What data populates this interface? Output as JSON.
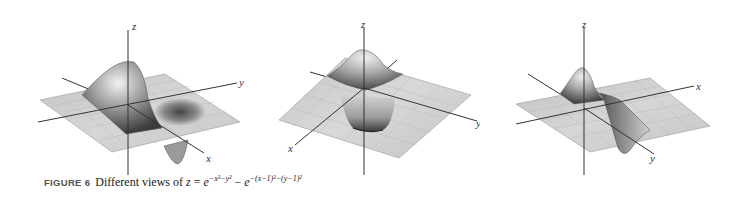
{
  "figure": {
    "number_label": "FIGURE 6",
    "caption_text": "Different views of",
    "equation": {
      "lhs": "z",
      "equals": "=",
      "term1_base": "e",
      "term1_exponent": "−x²−y²",
      "minus": "−",
      "term2_base": "e",
      "term2_exponent": "−(x−1)²−(y−1)²"
    }
  },
  "panels": [
    {
      "id": "view-1",
      "axis_labels": {
        "z": "z",
        "y": "y",
        "x": "x"
      },
      "description": "Surface with peak near origin and pit near (1,1), viewed with x-axis toward lower right"
    },
    {
      "id": "view-2",
      "axis_labels": {
        "z": "z",
        "y": "y",
        "x": "x"
      },
      "description": "Surface viewed with peak at back and pit in front, x-axis toward lower left"
    },
    {
      "id": "view-3",
      "axis_labels": {
        "z": "z",
        "x": "x",
        "y": "y"
      },
      "description": "Surface viewed from side, x-axis to the right, y-axis toward lower right"
    }
  ],
  "colors": {
    "surface_light": "#d8d8d8",
    "surface_mid": "#a8a8a8",
    "surface_dark": "#3a3a3a",
    "grid": "#bdbdbd",
    "axis": "#333333",
    "background": "#ffffff"
  }
}
